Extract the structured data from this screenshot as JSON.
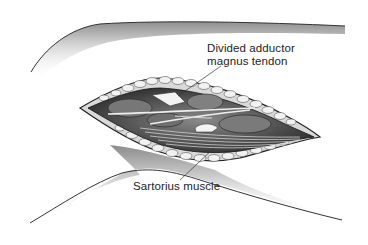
{
  "figure": {
    "labels": [
      {
        "id": "adductor",
        "lines": [
          "Divided adductor",
          "magnus tendon"
        ]
      },
      {
        "id": "sartorius",
        "lines": [
          "Sartorius muscle"
        ]
      }
    ]
  }
}
